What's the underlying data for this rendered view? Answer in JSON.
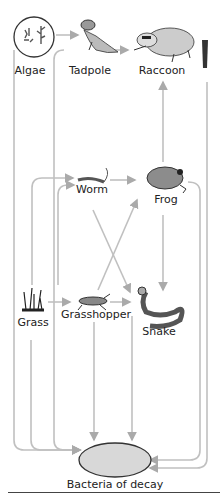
{
  "diagram": {
    "organisms": [
      {
        "id": "algae",
        "label": "Algae",
        "icon": "algae-icon",
        "x": 30,
        "y": 72
      },
      {
        "id": "tadpole",
        "label": "Tadpole",
        "icon": "tadpole-icon",
        "x": 90,
        "y": 72
      },
      {
        "id": "raccoon",
        "label": "Raccoon",
        "icon": "raccoon-icon",
        "x": 162,
        "y": 72
      },
      {
        "id": "worm",
        "label": "Worm",
        "icon": "worm-icon",
        "x": 93,
        "y": 190
      },
      {
        "id": "frog",
        "label": "Frog",
        "icon": "frog-icon",
        "x": 166,
        "y": 200
      },
      {
        "id": "grass",
        "label": "Grass",
        "icon": "grass-icon",
        "x": 33,
        "y": 324
      },
      {
        "id": "grasshopper",
        "label": "Grasshopper",
        "icon": "grasshopper-icon",
        "x": 96,
        "y": 316
      },
      {
        "id": "snake",
        "label": "Snake",
        "icon": "snake-icon",
        "x": 159,
        "y": 332
      },
      {
        "id": "bacteria",
        "label": "Bacteria of decay",
        "icon": "bacteria-icon",
        "x": 115,
        "y": 487
      }
    ],
    "arrows": [
      {
        "from": "algae",
        "to": "tadpole"
      },
      {
        "from": "tadpole",
        "to": "raccoon"
      },
      {
        "from": "frog",
        "to": "raccoon"
      },
      {
        "from": "grass",
        "to": "worm"
      },
      {
        "from": "worm",
        "to": "frog"
      },
      {
        "from": "worm",
        "to": "snake"
      },
      {
        "from": "grasshopper",
        "to": "frog"
      },
      {
        "from": "grass",
        "to": "grasshopper"
      },
      {
        "from": "grasshopper",
        "to": "snake"
      },
      {
        "from": "frog",
        "to": "snake"
      },
      {
        "from": "algae",
        "to": "bacteria"
      },
      {
        "from": "tadpole",
        "to": "bacteria"
      },
      {
        "from": "grass",
        "to": "bacteria"
      },
      {
        "from": "grasshopper",
        "to": "bacteria"
      },
      {
        "from": "snake",
        "to": "bacteria"
      },
      {
        "from": "frog",
        "to": "bacteria"
      },
      {
        "from": "raccoon",
        "to": "bacteria"
      }
    ],
    "colors": {
      "arrow": "#b8b8b8",
      "outline": "#333333",
      "fill": "#9a9a9a"
    }
  }
}
